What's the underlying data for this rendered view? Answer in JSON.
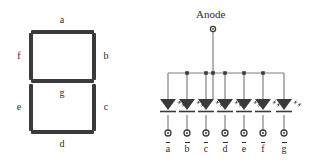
{
  "figure": {
    "title": "",
    "display": {
      "name": "seven-segment-display",
      "segments": [
        {
          "id": "a",
          "label": "a",
          "orientation": "horizontal",
          "position": "top"
        },
        {
          "id": "b",
          "label": "b",
          "orientation": "vertical",
          "position": "top-right"
        },
        {
          "id": "c",
          "label": "c",
          "orientation": "vertical",
          "position": "bottom-right"
        },
        {
          "id": "d",
          "label": "d",
          "orientation": "horizontal",
          "position": "bottom"
        },
        {
          "id": "e",
          "label": "e",
          "orientation": "vertical",
          "position": "bottom-left"
        },
        {
          "id": "f",
          "label": "f",
          "orientation": "vertical",
          "position": "top-left"
        },
        {
          "id": "g",
          "label": "g",
          "orientation": "horizontal",
          "position": "middle"
        }
      ],
      "segment_color": "#3a3a3a",
      "label_color": "#2b2b2b"
    },
    "circuit": {
      "name": "common-anode-led-array",
      "anode_label": "Anode",
      "anode_terminal": "circle-terminal",
      "led_count": 7,
      "wire_color": "#808080",
      "led_color": "#3a3a3a",
      "terminals": [
        {
          "id": "a-bar",
          "letter": "a",
          "overline": true
        },
        {
          "id": "b-bar",
          "letter": "b",
          "overline": true
        },
        {
          "id": "c-bar",
          "letter": "c",
          "overline": true
        },
        {
          "id": "d-bar",
          "letter": "d",
          "overline": true
        },
        {
          "id": "e-bar",
          "letter": "e",
          "overline": true
        },
        {
          "id": "f-bar",
          "letter": "f",
          "overline": true
        },
        {
          "id": "g-bar",
          "letter": "g",
          "overline": true
        }
      ]
    }
  }
}
